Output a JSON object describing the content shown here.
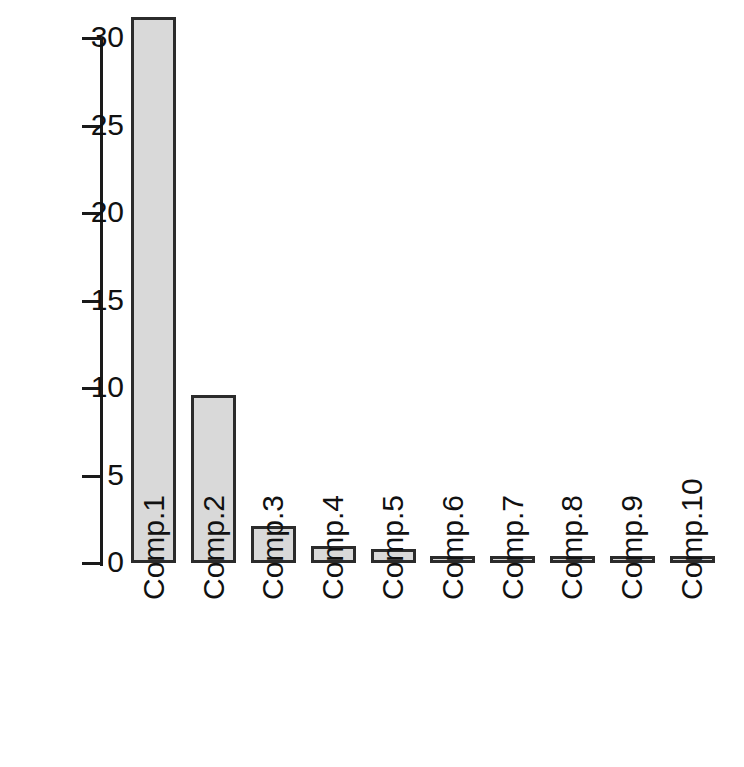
{
  "chart_data": {
    "type": "bar",
    "title": "",
    "subtitle": "",
    "xlabel": "",
    "ylabel": "",
    "categories": [
      "Comp.1",
      "Comp.2",
      "Comp.3",
      "Comp.4",
      "Comp.5",
      "Comp.6",
      "Comp.7",
      "Comp.8",
      "Comp.9",
      "Comp.10"
    ],
    "values": [
      31.2,
      9.6,
      2.1,
      1.0,
      0.8,
      0.35,
      0.25,
      0.2,
      0.12,
      0.1
    ],
    "ylim": [
      0,
      31.5
    ],
    "ytick_labels": [
      "0",
      "5",
      "10",
      "15",
      "20",
      "25",
      "30"
    ],
    "ytick_values": [
      0,
      5,
      10,
      15,
      20,
      25,
      30
    ],
    "xtick_labels": [
      "Comp.1",
      "Comp.2",
      "Comp.3",
      "Comp.4",
      "Comp.5",
      "Comp.6",
      "Comp.7",
      "Comp.8",
      "Comp.9",
      "Comp.10"
    ],
    "xtick_rotation": -90,
    "grid": false,
    "legend": null,
    "legend_position": "none",
    "bar_fill_color": "#d9d9d9",
    "bar_border_color": "#2b2b2b",
    "axis_color": "#1a1a1a",
    "text_color": "#111111",
    "background_color": "#ffffff",
    "annotations": []
  }
}
